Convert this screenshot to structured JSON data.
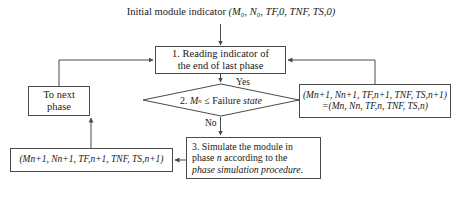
{
  "diagram": {
    "type": "flowchart",
    "background": "#ffffff",
    "stroke_color": "#4a4a4a",
    "text_color": "#1a1a1a"
  },
  "nodes": {
    "top_label": {
      "text": "Initial module indicator (M0, N0, TF,0, TNF, TS,0)",
      "shape": "text",
      "prefix": "Initial module indicator",
      "tuple": "(M₀, N₀, TF,0, TNF, TS,0)"
    },
    "reading": {
      "line1": "1. Reading indicator of",
      "line2": "the end of last phase",
      "shape": "rectangle"
    },
    "decision": {
      "text": "2. Mn ≤ Failure state",
      "number": "2.",
      "variable": "M",
      "subscript": "n",
      "operator": "≤",
      "predicate_plain": "Failure",
      "predicate_italic": "state",
      "shape": "diamond"
    },
    "next_phase": {
      "line1": "To next",
      "line2": "phase",
      "shape": "rectangle"
    },
    "update": {
      "line1": "(Mn+1, Nn+1, TF,n+1, TNF, TS,n+1)",
      "line2": "=(Mn, Nn, TF,n, TNF, TS,n)",
      "shape": "rectangle"
    },
    "simulate": {
      "line1": "3. Simulate the module in",
      "line2_plain_a": "phase ",
      "line2_italic": "n",
      "line2_plain_b": " according to the",
      "line3_italic": "phase simulation procedure.",
      "shape": "rectangle"
    },
    "result": {
      "text": "(Mn+1, Nn+1, TF,n+1, TNF, TS,n+1)",
      "shape": "rectangle"
    }
  },
  "edge_labels": {
    "yes": "Yes",
    "no": "No"
  },
  "edges": [
    {
      "from": "top_label",
      "to": "reading",
      "label": ""
    },
    {
      "from": "reading",
      "to": "decision",
      "label": ""
    },
    {
      "from": "decision",
      "to": "update",
      "label": "Yes"
    },
    {
      "from": "decision",
      "to": "simulate",
      "label": "No"
    },
    {
      "from": "update",
      "to": "reading",
      "label": ""
    },
    {
      "from": "simulate",
      "to": "result",
      "label": ""
    },
    {
      "from": "result",
      "to": "next_phase",
      "label": ""
    },
    {
      "from": "next_phase",
      "to": "reading",
      "label": ""
    }
  ]
}
